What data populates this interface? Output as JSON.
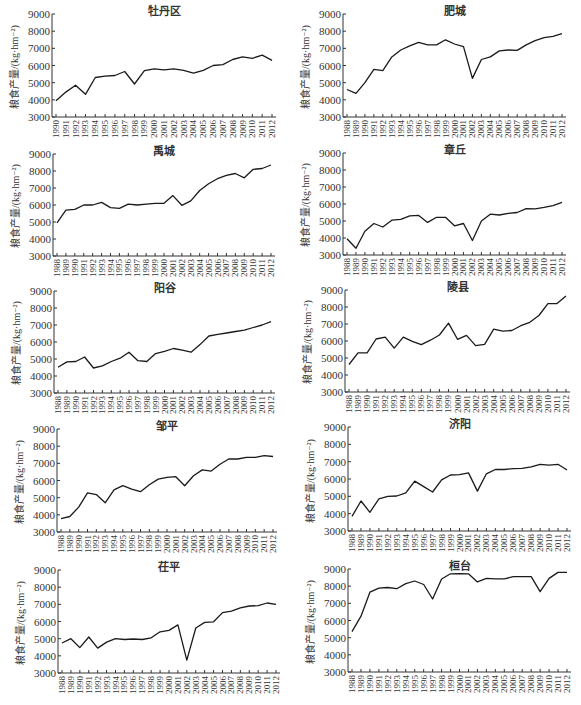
{
  "figure": {
    "ylabel": "粮食产量/(kg·hm⁻²)",
    "yticks": [
      3000,
      4000,
      5000,
      6000,
      7000,
      8000,
      9000
    ]
  },
  "chart_data": [
    {
      "type": "line",
      "title": "牡丹区",
      "xlabel": "",
      "ylabel": "粮食产量/(kg·hm⁻²)",
      "ylim": [
        3000,
        9000
      ],
      "grid": false,
      "categories": [
        "1990",
        "1991",
        "1992",
        "1993",
        "1994",
        "1995",
        "1996",
        "1997",
        "1998",
        "1999",
        "2000",
        "2001",
        "2002",
        "2003",
        "2004",
        "2005",
        "2006",
        "2007",
        "2008",
        "2009",
        "2010",
        "2011",
        "2012"
      ],
      "values": [
        3950,
        4450,
        4850,
        4320,
        5300,
        5380,
        5420,
        5650,
        4920,
        5700,
        5800,
        5750,
        5800,
        5720,
        5550,
        5720,
        6000,
        6050,
        6350,
        6500,
        6420,
        6600,
        6300
      ]
    },
    {
      "type": "line",
      "title": "肥城",
      "xlabel": "",
      "ylabel": "粮食产量/(kg·hm⁻²)",
      "ylim": [
        3000,
        9000
      ],
      "grid": false,
      "categories": [
        "1988",
        "1989",
        "1990",
        "1991",
        "1992",
        "1993",
        "1994",
        "1995",
        "1996",
        "1997",
        "1998",
        "1999",
        "2000",
        "2001",
        "2002",
        "2003",
        "2004",
        "2005",
        "2006",
        "2007",
        "2008",
        "2009",
        "2010",
        "2011",
        "2012"
      ],
      "values": [
        4600,
        4380,
        5000,
        5780,
        5700,
        6500,
        6900,
        7150,
        7350,
        7200,
        7200,
        7500,
        7250,
        7100,
        5250,
        6350,
        6500,
        6850,
        6900,
        6880,
        7200,
        7450,
        7620,
        7700,
        7850
      ]
    },
    {
      "type": "line",
      "title": "禹城",
      "xlabel": "",
      "ylabel": "粮食产量/(kg·hm⁻²)",
      "ylim": [
        3000,
        9000
      ],
      "grid": false,
      "categories": [
        "1988",
        "1989",
        "1990",
        "1991",
        "1992",
        "1993",
        "1994",
        "1995",
        "1996",
        "1997",
        "1998",
        "1999",
        "2000",
        "2001",
        "2002",
        "2003",
        "2004",
        "2005",
        "2006",
        "2007",
        "2008",
        "2009",
        "2010",
        "2011",
        "2012"
      ],
      "values": [
        4950,
        5700,
        5750,
        6000,
        6000,
        6150,
        5850,
        5800,
        6050,
        6000,
        6050,
        6100,
        6100,
        6550,
        5980,
        6250,
        6850,
        7250,
        7550,
        7750,
        7850,
        7600,
        8100,
        8150,
        8350
      ]
    },
    {
      "type": "line",
      "title": "章丘",
      "xlabel": "",
      "ylabel": "粮食产量/(kg·hm⁻²)",
      "ylim": [
        3000,
        9000
      ],
      "grid": false,
      "categories": [
        "1988",
        "1989",
        "1990",
        "1991",
        "1992",
        "1993",
        "1994",
        "1995",
        "1996",
        "1997",
        "1998",
        "1999",
        "2000",
        "2001",
        "2002",
        "2003",
        "2004",
        "2005",
        "2006",
        "2007",
        "2008",
        "2009",
        "2010",
        "2011",
        "2012"
      ],
      "values": [
        3950,
        3400,
        4400,
        4850,
        4650,
        5050,
        5100,
        5300,
        5330,
        4920,
        5220,
        5220,
        4720,
        4850,
        3850,
        5000,
        5400,
        5350,
        5450,
        5500,
        5730,
        5720,
        5800,
        5900,
        6100
      ]
    },
    {
      "type": "line",
      "title": "阳谷",
      "xlabel": "",
      "ylabel": "粮食产量/(kg·hm⁻²)",
      "ylim": [
        3000,
        9000
      ],
      "grid": false,
      "categories": [
        "1988",
        "1989",
        "1990",
        "1991",
        "1992",
        "1993",
        "1994",
        "1995",
        "1996",
        "1997",
        "1998",
        "1999",
        "2000",
        "2001",
        "2002",
        "2003",
        "2004",
        "2005",
        "2006",
        "2007",
        "2008",
        "2009",
        "2010",
        "2011",
        "2012"
      ],
      "values": [
        4520,
        4830,
        4850,
        5120,
        4470,
        4600,
        4850,
        5050,
        5400,
        4900,
        4850,
        5320,
        5450,
        5620,
        5520,
        5400,
        5850,
        6350,
        6450,
        6530,
        6620,
        6700,
        6850,
        7000,
        7200
      ]
    },
    {
      "type": "line",
      "title": "陵县",
      "xlabel": "",
      "ylabel": "粮食产量/(kg·hm⁻²)",
      "ylim": [
        3000,
        9000
      ],
      "grid": false,
      "categories": [
        "1988",
        "1989",
        "1990",
        "1991",
        "1992",
        "1993",
        "1994",
        "1995",
        "1996",
        "1997",
        "1998",
        "1999",
        "2000",
        "2001",
        "2002",
        "2003",
        "2004",
        "2005",
        "2006",
        "2007",
        "2008",
        "2009",
        "2010",
        "2011",
        "2012"
      ],
      "values": [
        4620,
        5300,
        5300,
        6120,
        6230,
        5580,
        6230,
        5980,
        5780,
        6050,
        6350,
        7050,
        6100,
        6330,
        5730,
        5800,
        6700,
        6580,
        6620,
        6900,
        7100,
        7500,
        8200,
        8200,
        8650
      ]
    },
    {
      "type": "line",
      "title": "邹平",
      "xlabel": "",
      "ylabel": "粮食产量/(kg·hm⁻²)",
      "ylim": [
        3000,
        9000
      ],
      "grid": false,
      "categories": [
        "1988",
        "1989",
        "1990",
        "1991",
        "1992",
        "1993",
        "1994",
        "1995",
        "1996",
        "1997",
        "1998",
        "1999",
        "2000",
        "2001",
        "2002",
        "2003",
        "2004",
        "2005",
        "2006",
        "2007",
        "2008",
        "2009",
        "2010",
        "2011",
        "2012"
      ],
      "values": [
        3780,
        3900,
        4450,
        5280,
        5180,
        4700,
        5450,
        5700,
        5500,
        5350,
        5750,
        6080,
        6180,
        6220,
        5700,
        6280,
        6620,
        6550,
        6950,
        7250,
        7250,
        7350,
        7350,
        7450,
        7400
      ]
    },
    {
      "type": "line",
      "title": "济阳",
      "xlabel": "",
      "ylabel": "粮食产量/(kg·hm⁻²)",
      "ylim": [
        3000,
        9000
      ],
      "grid": false,
      "categories": [
        "1988",
        "1989",
        "1990",
        "1991",
        "1992",
        "1993",
        "1994",
        "1995",
        "1996",
        "1997",
        "1998",
        "1999",
        "2000",
        "2001",
        "2002",
        "2003",
        "2004",
        "2005",
        "2006",
        "2007",
        "2008",
        "2009",
        "2010",
        "2011",
        "2012"
      ],
      "values": [
        3850,
        4730,
        4080,
        4850,
        5000,
        5020,
        5200,
        5880,
        5560,
        5250,
        5950,
        6230,
        6250,
        6350,
        5300,
        6300,
        6550,
        6550,
        6600,
        6620,
        6700,
        6850,
        6800,
        6850,
        6520
      ]
    },
    {
      "type": "line",
      "title": "茌平",
      "xlabel": "",
      "ylabel": "粮食产量/(kg·hm⁻²)",
      "ylim": [
        3000,
        9000
      ],
      "grid": false,
      "categories": [
        "1988",
        "1989",
        "1990",
        "1991",
        "1992",
        "1993",
        "1994",
        "1995",
        "1996",
        "1997",
        "1998",
        "1999",
        "2000",
        "2001",
        "2002",
        "2003",
        "2004",
        "2005",
        "2006",
        "2007",
        "2008",
        "2009",
        "2010",
        "2011",
        "2012"
      ],
      "values": [
        4750,
        5000,
        4480,
        5100,
        4450,
        4800,
        5000,
        4950,
        4980,
        4950,
        5050,
        5400,
        5480,
        5800,
        3750,
        5620,
        5950,
        5980,
        6520,
        6600,
        6800,
        6900,
        6920,
        7080,
        7000
      ]
    },
    {
      "type": "line",
      "title": "桓台",
      "xlabel": "",
      "ylabel": "粮食产量/(kg·hm⁻²)",
      "ylim": [
        3000,
        9000
      ],
      "grid": false,
      "categories": [
        "1988",
        "1989",
        "1990",
        "1991",
        "1992",
        "1993",
        "1994",
        "1995",
        "1996",
        "1997",
        "1998",
        "1999",
        "2000",
        "2001",
        "2002",
        "2003",
        "2004",
        "2005",
        "2006",
        "2007",
        "2008",
        "2009",
        "2010",
        "2011",
        "2012"
      ],
      "values": [
        5350,
        6250,
        7650,
        7880,
        7920,
        7850,
        8150,
        8300,
        8100,
        7250,
        8420,
        8720,
        8730,
        8720,
        8250,
        8450,
        8430,
        8430,
        8550,
        8550,
        8550,
        7680,
        8450,
        8800,
        8800
      ]
    }
  ]
}
